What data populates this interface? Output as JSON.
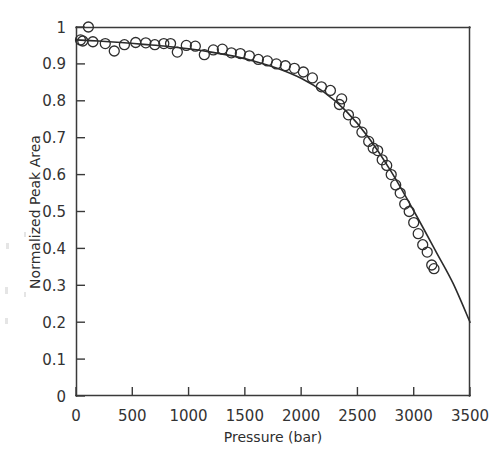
{
  "chart_data": {
    "type": "scatter",
    "title": "",
    "subtitle": "",
    "xlabel": "Pressure (bar)",
    "ylabel": "Normalized Peak Area",
    "xlim": [
      0,
      3500
    ],
    "ylim": [
      0,
      1
    ],
    "grid": false,
    "legend": null,
    "legend_position": "none",
    "xticks": [
      0,
      500,
      1000,
      1500,
      2000,
      2500,
      3000,
      3500
    ],
    "xtick_labels": [
      "0",
      "500",
      "1000",
      "1500",
      "2000",
      "2500",
      "3000",
      "3500"
    ],
    "yticks": [
      0,
      0.1,
      0.2,
      0.3,
      0.4,
      0.5,
      0.6,
      0.7,
      0.8,
      0.9,
      1
    ],
    "ytick_labels": [
      "0",
      "0.1",
      "0.2",
      "0.3",
      "0.4",
      "0.5",
      "0.6",
      "0.7",
      "0.8",
      "0.9",
      "1"
    ],
    "marker": "open-circle",
    "marker_size": 7,
    "series": [
      {
        "name": "Normalized Peak Area data",
        "type": "scatter",
        "x": [
          40,
          60,
          110,
          150,
          260,
          340,
          430,
          530,
          620,
          700,
          780,
          840,
          900,
          980,
          1060,
          1140,
          1220,
          1300,
          1380,
          1460,
          1540,
          1620,
          1700,
          1780,
          1860,
          1940,
          2020,
          2100,
          2180,
          2260,
          2340,
          2360,
          2420,
          2480,
          2540,
          2600,
          2640,
          2680,
          2720,
          2760,
          2800,
          2840,
          2880,
          2920,
          2960,
          3000,
          3040,
          3080,
          3120,
          3160,
          3180
        ],
        "y": [
          0.965,
          0.962,
          1.0,
          0.96,
          0.955,
          0.935,
          0.952,
          0.958,
          0.957,
          0.952,
          0.955,
          0.955,
          0.932,
          0.95,
          0.948,
          0.925,
          0.938,
          0.94,
          0.93,
          0.928,
          0.922,
          0.912,
          0.908,
          0.9,
          0.895,
          0.888,
          0.878,
          0.862,
          0.838,
          0.828,
          0.79,
          0.805,
          0.762,
          0.742,
          0.715,
          0.69,
          0.672,
          0.665,
          0.64,
          0.625,
          0.6,
          0.572,
          0.55,
          0.52,
          0.5,
          0.47,
          0.44,
          0.41,
          0.39,
          0.355,
          0.345
        ]
      },
      {
        "name": "Fitted curve",
        "type": "line",
        "x": [
          0,
          200,
          400,
          600,
          800,
          1000,
          1200,
          1400,
          1600,
          1800,
          2000,
          2200,
          2400,
          2600,
          2800,
          3000,
          3200,
          3350,
          3500
        ],
        "y": [
          0.965,
          0.962,
          0.958,
          0.953,
          0.948,
          0.941,
          0.932,
          0.921,
          0.906,
          0.887,
          0.861,
          0.824,
          0.772,
          0.7,
          0.608,
          0.502,
          0.39,
          0.305,
          0.2
        ]
      }
    ]
  }
}
